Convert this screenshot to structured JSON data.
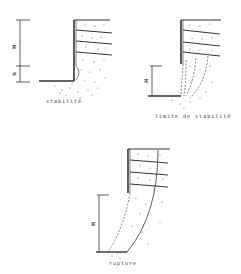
{
  "figure": {
    "panels": [
      {
        "id": "stability",
        "caption": "stabilité",
        "height_label": "H",
        "small_label": "h"
      },
      {
        "id": "stability-limit",
        "caption": "limite de stabilité",
        "height_label": "H"
      },
      {
        "id": "rupture",
        "caption": "rupture",
        "height_label": "H"
      }
    ],
    "colors": {
      "line": "#333333",
      "dots": "#555555",
      "background": "#ffffff"
    }
  }
}
